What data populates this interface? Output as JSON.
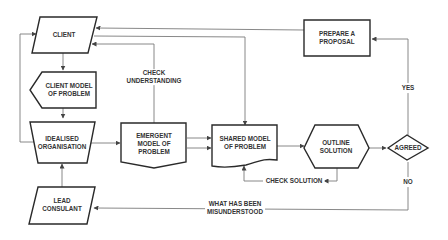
{
  "diagram": {
    "type": "flowchart",
    "nodes": {
      "client": "CLIENT",
      "client_model": [
        "CLIENT MODEL",
        "OF PROBLEM"
      ],
      "idealised": [
        "IDEALISED",
        "ORGANISATION"
      ],
      "lead": [
        "LEAD",
        "CONSULANT"
      ],
      "emergent": [
        "EMERGENT",
        "MODEL OF",
        "PROBLEM"
      ],
      "shared": [
        "SHARED MODEL",
        "OF PROBLEM"
      ],
      "outline": [
        "OUTLINE",
        "SOLUTION"
      ],
      "agreed": "AGREED",
      "proposal": [
        "PREPARE A",
        "PROPOSAL"
      ]
    },
    "edge_labels": {
      "check_understanding": [
        "CHECK",
        "UNDERSTANDING"
      ],
      "check_solution": "CHECK SOLUTION",
      "misunderstood": [
        "WHAT HAS BEEN",
        "MISUNDERSTOOD"
      ],
      "yes": "YES",
      "no": "NO"
    },
    "colors": {
      "stroke": "#2a2a2a",
      "connector": "#7a7a7a",
      "text": "#333333"
    }
  }
}
